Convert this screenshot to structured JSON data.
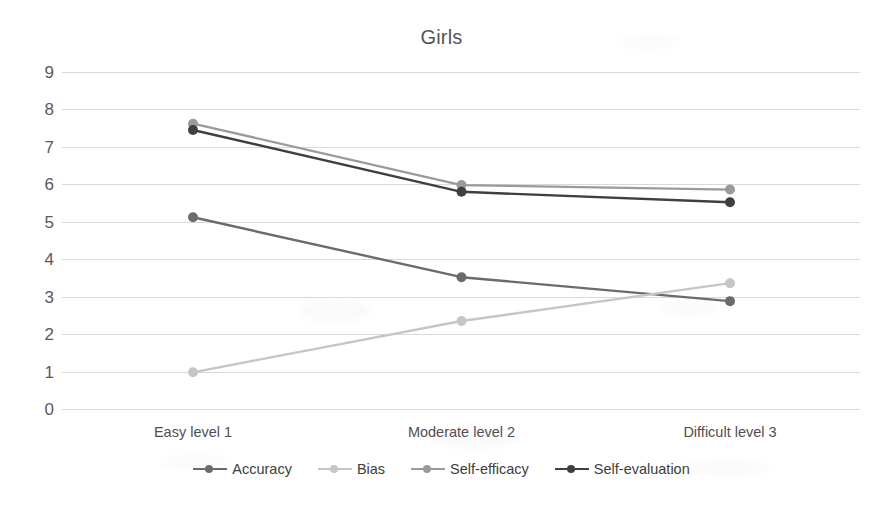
{
  "chart_data": {
    "type": "line",
    "title": "Girls",
    "xlabel": "",
    "ylabel": "",
    "categories": [
      "Easy level 1",
      "Moderate level 2",
      "Difficult level 3"
    ],
    "ylim": [
      0,
      9
    ],
    "yticks": [
      9,
      8,
      7,
      6,
      5,
      4,
      3,
      2,
      1,
      0
    ],
    "grid": true,
    "legend_position": "bottom",
    "markers": "circle",
    "series": [
      {
        "name": "Accuracy",
        "values": [
          5.12,
          3.52,
          2.88
        ],
        "color": "#6b6b6b"
      },
      {
        "name": "Bias",
        "values": [
          0.98,
          2.35,
          3.36
        ],
        "color": "#c6c6c6"
      },
      {
        "name": "Self-efficacy",
        "values": [
          7.62,
          5.98,
          5.86
        ],
        "color": "#9a9a9a"
      },
      {
        "name": "Self-evaluation",
        "values": [
          7.45,
          5.8,
          5.52
        ],
        "color": "#3f3f3f"
      }
    ]
  },
  "colors": {
    "gridline": "#d9d9d9",
    "text": "#4a4a4a",
    "title": "#555555",
    "background": "#ffffff"
  }
}
